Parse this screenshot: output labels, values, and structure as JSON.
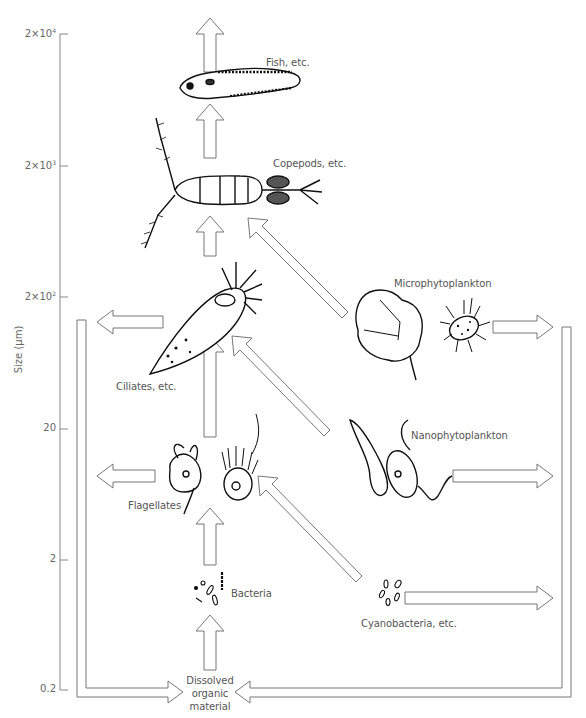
{
  "diagram": {
    "type": "microbial-food-web",
    "y_axis": {
      "label": "Size (µm)",
      "ticks": [
        {
          "mantissa": "2×10",
          "exp": "4",
          "y": 34
        },
        {
          "mantissa": "2×10",
          "exp": "3",
          "y": 166
        },
        {
          "mantissa": "2×10",
          "exp": "2",
          "y": 297
        },
        {
          "mantissa": "20",
          "exp": "",
          "y": 429
        },
        {
          "mantissa": "2",
          "exp": "",
          "y": 560
        },
        {
          "mantissa": "0.2",
          "exp": "",
          "y": 690
        }
      ]
    },
    "nodes": {
      "fish": "Fish, etc.",
      "copepods": "Copepods, etc.",
      "ciliates": "Ciliates, etc.",
      "microphytoplankton": "Microphytoplankton",
      "nanophytoplankton": "Nanophytoplankton",
      "flagellates": "Flagellates",
      "bacteria": "Bacteria",
      "cyanobacteria": "Cyanobacteria, etc.",
      "dom_line1": "Dissolved",
      "dom_line2": "organic",
      "dom_line3": "material"
    },
    "edges": [
      {
        "from": "fish",
        "to": "higher trophic levels"
      },
      {
        "from": "copepods",
        "to": "fish"
      },
      {
        "from": "ciliates",
        "to": "copepods"
      },
      {
        "from": "microphytoplankton",
        "to": "copepods"
      },
      {
        "from": "flagellates",
        "to": "ciliates"
      },
      {
        "from": "nanophytoplankton",
        "to": "ciliates"
      },
      {
        "from": "bacteria",
        "to": "flagellates"
      },
      {
        "from": "cyanobacteria",
        "to": "flagellates"
      },
      {
        "from": "dissolved organic material",
        "to": "bacteria"
      },
      {
        "from": "ciliates",
        "to": "dissolved organic material (left loop)"
      },
      {
        "from": "flagellates",
        "to": "dissolved organic material (left loop)"
      },
      {
        "from": "microphytoplankton",
        "to": "dissolved organic material (right loop)"
      },
      {
        "from": "nanophytoplankton",
        "to": "dissolved organic material (right loop)"
      },
      {
        "from": "cyanobacteria",
        "to": "dissolved organic material (right loop)"
      }
    ],
    "colors": {
      "arrow_stroke": "#777777",
      "drawing": "#111111",
      "text": "#555555"
    }
  }
}
